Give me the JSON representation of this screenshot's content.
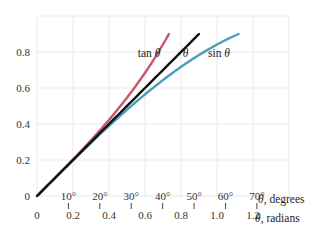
{
  "chart_data": {
    "type": "line",
    "title": "",
    "xlabel": "θ, radians",
    "x2label": "θ, degrees",
    "ylabel": "",
    "xlim": [
      0,
      1.4
    ],
    "ylim": [
      0,
      1.0
    ],
    "grid": true,
    "x_ticks": [
      "0",
      "0.2",
      "0.4",
      "0.6",
      "0.8",
      "1.0",
      "1.2"
    ],
    "x_tick_values": [
      0,
      0.2,
      0.4,
      0.6,
      0.8,
      1.0,
      1.2
    ],
    "y_ticks": [
      "0",
      "0.2",
      "0.4",
      "0.6",
      "0.8"
    ],
    "y_tick_values": [
      0,
      0.2,
      0.4,
      0.6,
      0.8
    ],
    "degree_ticks": [
      "10°",
      "20°",
      "30°",
      "40°",
      "50°",
      "60°",
      "70°"
    ],
    "degree_tick_values": [
      10,
      20,
      30,
      40,
      50,
      60,
      70
    ],
    "series": [
      {
        "name": "tan θ",
        "color": "#c9566e",
        "function": "tan",
        "x_range": [
          0,
          0.733
        ],
        "x": [
          0,
          0.2,
          0.4,
          0.6,
          0.733
        ],
        "values": [
          0,
          0.203,
          0.423,
          0.684,
          0.9
        ]
      },
      {
        "name": "θ",
        "color": "#111111",
        "function": "identity",
        "x_range": [
          0,
          0.9
        ],
        "x": [
          0,
          0.2,
          0.4,
          0.6,
          0.9
        ],
        "values": [
          0,
          0.2,
          0.4,
          0.6,
          0.9
        ]
      },
      {
        "name": "sin θ",
        "color": "#4b9dbb",
        "function": "sin",
        "x_range": [
          0,
          1.12
        ],
        "x": [
          0,
          0.2,
          0.4,
          0.6,
          0.8,
          1.0,
          1.12
        ],
        "values": [
          0,
          0.199,
          0.389,
          0.565,
          0.717,
          0.841,
          0.9
        ]
      }
    ],
    "annotations": [
      {
        "text": "tan θ",
        "x": 0.56,
        "y": 0.77
      },
      {
        "text": "θ",
        "x": 0.81,
        "y": 0.77
      },
      {
        "text": "sin θ",
        "x": 0.95,
        "y": 0.77
      }
    ]
  }
}
